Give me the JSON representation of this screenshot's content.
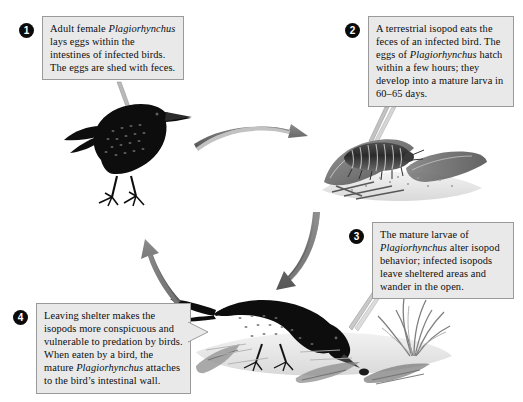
{
  "diagram": {
    "organism": "Plagiorhynchus",
    "colors": {
      "box_background": "#e9e9e9",
      "box_border": "#9a9a9a",
      "badge_fill": "#0b0b0b",
      "badge_text": "#ffffff",
      "arrow": "#6e6e6e",
      "bird": "#0d0d0d",
      "page_background": "#ffffff"
    },
    "steps": [
      {
        "number": "1",
        "badge_name": "step-1-badge",
        "text_parts": [
          {
            "t": "Adult female ",
            "i": false
          },
          {
            "t": "Plagiorhynchus",
            "i": true
          },
          {
            "t": " lays eggs within the intestines of infected birds. The eggs are shed with feces.",
            "i": false
          }
        ],
        "plain_text": "Adult female Plagiorhynchus lays eggs within the intestines of infected birds. The eggs are shed with feces.",
        "illustration": "adult-starling-standing"
      },
      {
        "number": "2",
        "badge_name": "step-2-badge",
        "text_parts": [
          {
            "t": "A terrestrial isopod eats the feces of an infected bird.  The eggs of ",
            "i": false
          },
          {
            "t": "Plagiorhynchus",
            "i": true
          },
          {
            "t": " hatch within a few hours; they develop into a mature larva in 60–65 days.",
            "i": false
          }
        ],
        "plain_text": "A terrestrial isopod eats the feces of an infected bird.  The eggs of Plagiorhynchus hatch within a few hours; they develop into a mature larva in 60–65 days.",
        "illustration": "isopod-on-leaf-litter"
      },
      {
        "number": "3",
        "badge_name": "step-3-badge",
        "text_parts": [
          {
            "t": "The mature larvae of ",
            "i": false
          },
          {
            "t": "Plagiorhynchus",
            "i": true
          },
          {
            "t": " alter isopod behavior; infected isopods leave sheltered areas and wander in the open.",
            "i": false
          }
        ],
        "plain_text": "The mature larvae of Plagiorhynchus alter isopod behavior; infected isopods leave sheltered areas and wander in the open.",
        "illustration": "grass-tuft"
      },
      {
        "number": "4",
        "badge_name": "step-4-badge",
        "text_parts": [
          {
            "t": "Leaving shelter makes the isopods more conspicuous and vulnerable to predation by birds. When eaten by a bird, the mature ",
            "i": false
          },
          {
            "t": "Plagiorhynchus",
            "i": true
          },
          {
            "t": " attaches to the bird’s intestinal wall.",
            "i": false
          }
        ],
        "plain_text": "Leaving shelter makes the isopods more conspicuous and vulnerable to predation by birds. When eaten by a bird, the mature Plagiorhynchus attaches to the bird’s intestinal wall.",
        "illustration": "starling-feeding-on-ground"
      }
    ],
    "arrows": [
      {
        "name": "arrow-step1-to-step2",
        "direction": "right"
      },
      {
        "name": "arrow-step2-to-step3",
        "direction": "down-left"
      },
      {
        "name": "arrow-step4-to-step1",
        "direction": "up-left"
      }
    ]
  }
}
